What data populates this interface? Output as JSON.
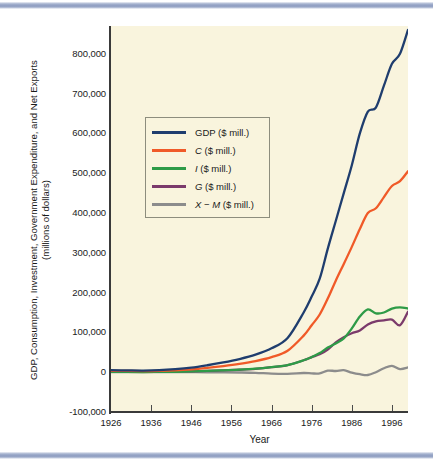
{
  "figure": {
    "background": "#ffffff",
    "plot_background": "#f9f4dd",
    "rule_color": "#8d9cc0"
  },
  "chart_data": {
    "type": "line",
    "title": "",
    "xlabel": "Year",
    "ylabel": "GDP, Consumption, Investment, Government Expenditure, and Net Exports (millions of dollars)",
    "ylabel_lines": [
      "GDP, Consumption, Investment, Government Expenditure, and Net Exports",
      "(millions of dollars)"
    ],
    "xlim": [
      1926,
      2000
    ],
    "ylim": [
      -100000,
      870000
    ],
    "grid": false,
    "legend_position": "upper-left-inside",
    "xticks": [
      1926,
      1936,
      1946,
      1956,
      1966,
      1976,
      1986,
      1996
    ],
    "xtick_labels": [
      "1926",
      "1936",
      "1946",
      "1956",
      "1966",
      "1976",
      "1986",
      "1996"
    ],
    "yticks": [
      -100000,
      0,
      100000,
      200000,
      300000,
      400000,
      500000,
      600000,
      700000,
      800000
    ],
    "ytick_labels": [
      "-100,000",
      "0",
      "100,000",
      "200,000",
      "300,000",
      "400,000",
      "500,000",
      "600,000",
      "700,000",
      "800,000"
    ],
    "x": [
      1926,
      1930,
      1934,
      1938,
      1942,
      1946,
      1950,
      1954,
      1958,
      1962,
      1966,
      1970,
      1974,
      1976,
      1978,
      1980,
      1982,
      1984,
      1986,
      1988,
      1990,
      1992,
      1994,
      1996,
      1998,
      2000
    ],
    "series": [
      {
        "name": "GDP ($ mill.)",
        "label": "GDP ($ mill.)",
        "color": "#1f3d6e",
        "values": [
          5200,
          4600,
          4200,
          5100,
          7600,
          11500,
          17500,
          24500,
          33000,
          44000,
          60000,
          86000,
          150000,
          190000,
          235000,
          310000,
          380000,
          450000,
          520000,
          600000,
          655000,
          665000,
          720000,
          775000,
          800000,
          860000
        ]
      },
      {
        "name": "C ($ mill.)",
        "label": "C ($ mill.)",
        "color": "#f05a28",
        "values": [
          3400,
          3100,
          2900,
          3400,
          4600,
          7200,
          11000,
          15500,
          21000,
          28000,
          38000,
          54000,
          92000,
          118000,
          145000,
          185000,
          230000,
          272000,
          315000,
          360000,
          400000,
          412000,
          440000,
          468000,
          480000,
          505000
        ]
      },
      {
        "name": "I ($ mill.)",
        "label": "I ($ mill.)",
        "color": "#2e9b47",
        "values": [
          900,
          600,
          500,
          700,
          1000,
          2000,
          3500,
          4800,
          6500,
          9000,
          13000,
          18000,
          30000,
          38000,
          48000,
          62000,
          72000,
          85000,
          110000,
          140000,
          158000,
          148000,
          150000,
          160000,
          163000,
          160000
        ]
      },
      {
        "name": "G ($ mill.)",
        "label": "G ($ mill.)",
        "color": "#7b3a6b",
        "values": [
          800,
          800,
          800,
          1000,
          1900,
          2300,
          3100,
          4500,
          6200,
          8500,
          12500,
          18000,
          30000,
          38000,
          45000,
          57000,
          75000,
          88000,
          98000,
          105000,
          120000,
          128000,
          130000,
          132000,
          118000,
          152000
        ]
      },
      {
        "name": "X − M ($ mill.)",
        "label": "X − M ($ mill.)",
        "color": "#8c8c8c",
        "values": [
          100,
          100,
          0,
          0,
          100,
          0,
          -100,
          -300,
          -700,
          -1500,
          -3500,
          -4000,
          -2000,
          -3000,
          -3000,
          4000,
          3000,
          5000,
          -1000,
          -5000,
          -7000,
          0,
          10000,
          16000,
          8000,
          12000
        ]
      }
    ]
  },
  "legend": {
    "entries": [
      {
        "label_main": "GDP",
        "label_rest": " ($ mill.)",
        "italic": false,
        "color": "#1f3d6e"
      },
      {
        "label_main": "C",
        "label_rest": " ($ mill.)",
        "italic": true,
        "color": "#f05a28"
      },
      {
        "label_main": "I",
        "label_rest": " ($ mill.)",
        "italic": true,
        "color": "#2e9b47"
      },
      {
        "label_main": "G",
        "label_rest": " ($ mill.)",
        "italic": true,
        "color": "#7b3a6b"
      },
      {
        "label_main": "X − M",
        "label_rest": " ($ mill.)",
        "italic": true,
        "color": "#8c8c8c"
      }
    ]
  }
}
